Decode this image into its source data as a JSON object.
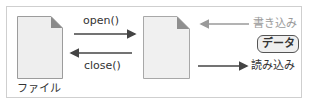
{
  "diagram": {
    "file_label": "ファイル",
    "open_label": "open()",
    "close_label": "close()",
    "write_label": "書き込み",
    "read_label": "読み込み",
    "data_label": "データ"
  },
  "colors": {
    "file_fill": "#eeeeee",
    "file_border": "#9c9c9c",
    "fold": "#8a8a8a",
    "dark_arrow": "#444444",
    "light_arrow": "#9a9a9a",
    "frame_border": "#cfcfcf"
  }
}
